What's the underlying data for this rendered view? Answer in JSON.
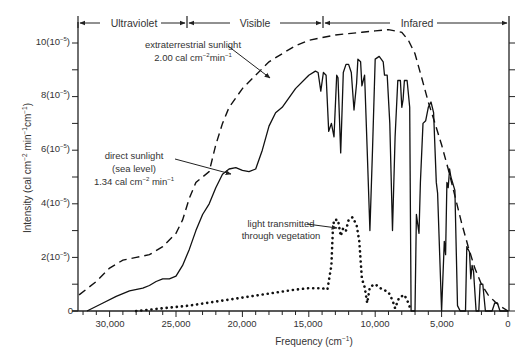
{
  "chart_data": {
    "type": "line",
    "title": "",
    "xlabel": "Frequency (cm⁻¹)",
    "ylabel": "Intensity (cal cm⁻² min⁻¹ cm⁻¹)",
    "xlim": [
      32300,
      0
    ],
    "ylim": [
      0,
      10.6
    ],
    "y_unit_multiplier": "10^-5",
    "x_ticks": [
      {
        "value": 30000,
        "label": "30,000"
      },
      {
        "value": 25000,
        "label": "25,000"
      },
      {
        "value": 20000,
        "label": "20,000"
      },
      {
        "value": 15000,
        "label": "15,000"
      },
      {
        "value": 10000,
        "label": "10,000"
      },
      {
        "value": 5000,
        "label": "5,000"
      },
      {
        "value": 0,
        "label": "0"
      }
    ],
    "y_ticks": [
      {
        "value": 0,
        "label": "0"
      },
      {
        "value": 2,
        "label": "2(10⁻⁵)"
      },
      {
        "value": 4,
        "label": "4(10⁻⁵)"
      },
      {
        "value": 6,
        "label": "6(10⁻⁵)"
      },
      {
        "value": 8,
        "label": "8(10⁻⁵)"
      },
      {
        "value": 10,
        "label": "10(10⁻⁵)"
      }
    ],
    "grid": false,
    "regions": [
      {
        "label": "Ultraviolet",
        "from": 32300,
        "to": 25000
      },
      {
        "label": "Visible",
        "from": 25000,
        "to": 14300
      },
      {
        "label": "Infared",
        "from": 14300,
        "to": 0
      }
    ],
    "series": [
      {
        "name": "extraterrestrial sunlight",
        "annotation": [
          "extraterrestrial sunlight",
          "2.00 cal cm⁻²min⁻¹"
        ],
        "style": "dashed",
        "points": [
          [
            32300,
            0.6
          ],
          [
            31000,
            1.1
          ],
          [
            30000,
            1.6
          ],
          [
            29000,
            1.9
          ],
          [
            28000,
            2.0
          ],
          [
            27000,
            2.1
          ],
          [
            26000,
            2.4
          ],
          [
            25000,
            2.9
          ],
          [
            24500,
            3.4
          ],
          [
            24000,
            4.2
          ],
          [
            23500,
            4.8
          ],
          [
            23000,
            5.0
          ],
          [
            22500,
            5.2
          ],
          [
            22000,
            6.2
          ],
          [
            21500,
            7.0
          ],
          [
            21000,
            7.6
          ],
          [
            20000,
            8.3
          ],
          [
            19000,
            8.8
          ],
          [
            18000,
            9.3
          ],
          [
            17000,
            9.6
          ],
          [
            16000,
            9.9
          ],
          [
            15000,
            10.1
          ],
          [
            14000,
            10.2
          ],
          [
            13000,
            10.3
          ],
          [
            12000,
            10.35
          ],
          [
            11000,
            10.4
          ],
          [
            10000,
            10.45
          ],
          [
            9000,
            10.5
          ],
          [
            8000,
            10.4
          ],
          [
            7500,
            10.1
          ],
          [
            7000,
            9.6
          ],
          [
            6500,
            8.7
          ],
          [
            6000,
            7.8
          ],
          [
            5500,
            7.0
          ],
          [
            5000,
            6.2
          ],
          [
            4500,
            5.3
          ],
          [
            4000,
            4.3
          ],
          [
            3500,
            3.3
          ],
          [
            3000,
            2.4
          ],
          [
            2500,
            1.6
          ],
          [
            2000,
            1.0
          ],
          [
            1500,
            0.6
          ],
          [
            1000,
            0.35
          ],
          [
            500,
            0.15
          ],
          [
            0,
            0.0
          ]
        ]
      },
      {
        "name": "direct sunlight (sea level)",
        "annotation": [
          "direct sunlight",
          "(sea level)",
          "1.34 cal cm⁻² min⁻¹"
        ],
        "style": "solid",
        "points": [
          [
            31700,
            0.0
          ],
          [
            30500,
            0.3
          ],
          [
            29500,
            0.55
          ],
          [
            28500,
            0.75
          ],
          [
            27500,
            0.85
          ],
          [
            27000,
            0.95
          ],
          [
            26500,
            1.1
          ],
          [
            26000,
            1.2
          ],
          [
            25500,
            1.2
          ],
          [
            25000,
            1.3
          ],
          [
            24500,
            1.7
          ],
          [
            24000,
            2.3
          ],
          [
            23500,
            3.0
          ],
          [
            23000,
            3.6
          ],
          [
            22500,
            4.0
          ],
          [
            22000,
            4.6
          ],
          [
            21500,
            5.1
          ],
          [
            21000,
            5.3
          ],
          [
            20500,
            5.35
          ],
          [
            20000,
            5.25
          ],
          [
            19500,
            5.2
          ],
          [
            19000,
            5.3
          ],
          [
            18500,
            6.0
          ],
          [
            18000,
            6.9
          ],
          [
            17500,
            7.4
          ],
          [
            17000,
            7.6
          ],
          [
            16000,
            8.3
          ],
          [
            15000,
            8.8
          ],
          [
            14500,
            8.95
          ],
          [
            14300,
            8.9
          ],
          [
            14100,
            8.2
          ],
          [
            13900,
            8.9
          ],
          [
            13700,
            8.8
          ],
          [
            13500,
            6.7
          ],
          [
            13300,
            7.0
          ],
          [
            13100,
            6.5
          ],
          [
            12900,
            8.8
          ],
          [
            12800,
            8.7
          ],
          [
            12600,
            5.9
          ],
          [
            12400,
            8.9
          ],
          [
            12200,
            9.2
          ],
          [
            12000,
            9.2
          ],
          [
            11800,
            8.9
          ],
          [
            11600,
            7.5
          ],
          [
            11400,
            8.5
          ],
          [
            11300,
            9.4
          ],
          [
            11100,
            9.3
          ],
          [
            11000,
            8.4
          ],
          [
            10800,
            8.8
          ],
          [
            10600,
            6.0
          ],
          [
            10400,
            3.0
          ],
          [
            10200,
            6.0
          ],
          [
            10000,
            9.4
          ],
          [
            9700,
            9.5
          ],
          [
            9400,
            9.3
          ],
          [
            9300,
            8.8
          ],
          [
            9100,
            8.8
          ],
          [
            8900,
            7.0
          ],
          [
            8700,
            3.0
          ],
          [
            8500,
            6.5
          ],
          [
            8300,
            8.6
          ],
          [
            8100,
            8.6
          ],
          [
            8000,
            7.6
          ],
          [
            7900,
            7.9
          ],
          [
            7800,
            8.6
          ],
          [
            7600,
            8.6
          ],
          [
            7400,
            7.6
          ],
          [
            7300,
            0.0
          ],
          [
            7000,
            0.0
          ],
          [
            6900,
            3.6
          ],
          [
            6700,
            2.9
          ],
          [
            6600,
            4.8
          ],
          [
            6400,
            7.0
          ],
          [
            6200,
            7.1
          ],
          [
            6000,
            7.6
          ],
          [
            5800,
            7.8
          ],
          [
            5600,
            7.4
          ],
          [
            5400,
            4.8
          ],
          [
            5300,
            4.4
          ],
          [
            5000,
            0.0
          ],
          [
            4800,
            2.6
          ],
          [
            4700,
            2.1
          ],
          [
            4600,
            4.8
          ],
          [
            4500,
            4.6
          ],
          [
            4400,
            5.3
          ],
          [
            4300,
            5.0
          ],
          [
            4000,
            4.5
          ],
          [
            3800,
            0.2
          ],
          [
            3600,
            0.0
          ],
          [
            3200,
            0.0
          ],
          [
            3100,
            2.4
          ],
          [
            2900,
            2.2
          ],
          [
            2800,
            1.2
          ],
          [
            2700,
            1.7
          ],
          [
            2600,
            1.5
          ],
          [
            2400,
            0.0
          ],
          [
            2200,
            0.0
          ],
          [
            2100,
            1.0
          ],
          [
            1900,
            1.0
          ],
          [
            1700,
            0.0
          ],
          [
            1200,
            0.0
          ],
          [
            1000,
            0.3
          ],
          [
            800,
            0.3
          ],
          [
            600,
            0.0
          ],
          [
            0,
            0.0
          ]
        ]
      },
      {
        "name": "light transmitted through vegetation",
        "annotation": [
          "light transmitted",
          "through vegetation"
        ],
        "style": "dotted",
        "points": [
          [
            28000,
            0.0
          ],
          [
            26000,
            0.1
          ],
          [
            24000,
            0.2
          ],
          [
            22000,
            0.35
          ],
          [
            20000,
            0.5
          ],
          [
            18000,
            0.65
          ],
          [
            16000,
            0.8
          ],
          [
            15000,
            0.85
          ],
          [
            14000,
            0.85
          ],
          [
            13600,
            0.8
          ],
          [
            13300,
            1.7
          ],
          [
            13200,
            2.9
          ],
          [
            13100,
            3.4
          ],
          [
            12800,
            3.4
          ],
          [
            12600,
            2.8
          ],
          [
            12400,
            3.1
          ],
          [
            12200,
            3.0
          ],
          [
            12000,
            3.4
          ],
          [
            11700,
            3.5
          ],
          [
            11400,
            3.2
          ],
          [
            11200,
            2.6
          ],
          [
            11000,
            1.2
          ],
          [
            10800,
            0.9
          ],
          [
            10600,
            0.3
          ],
          [
            10400,
            0.9
          ],
          [
            10000,
            1.0
          ],
          [
            9600,
            0.85
          ],
          [
            9000,
            0.7
          ],
          [
            8700,
            0.4
          ],
          [
            8500,
            0.1
          ],
          [
            8200,
            0.5
          ],
          [
            7800,
            0.6
          ],
          [
            7500,
            0.3
          ],
          [
            7300,
            0.0
          ]
        ]
      }
    ]
  },
  "labels": {
    "y0": "0",
    "y2": "2(10",
    "y4": "4(10",
    "y6": "6(10",
    "y8": "8(10",
    "y10": "10(10",
    "exp": "−5",
    "close": ")",
    "x30": "30,000",
    "x25": "25,000",
    "x20": "20,000",
    "x15": "15,000",
    "x10": "10,000",
    "x5": "5,000",
    "x0": "0",
    "xlabel_main": "Frequency (cm",
    "xlabel_exp": "−1",
    "xlabel_close": ")",
    "ylabel_main": "Intensity (cal cm",
    "ylabel_e1": "−2",
    "ylabel_mid": " min",
    "ylabel_e2": "−1",
    "ylabel_mid2": "cm",
    "ylabel_e3": "−1",
    "ylabel_close": ")",
    "region_uv": "Ultraviolet",
    "region_vis": "Visible",
    "region_ir": "Infared",
    "ann_et_1": "extraterrestrial sunlight",
    "ann_et_2a": "2.00 cal cm",
    "ann_et_2e": "−2",
    "ann_et_2b": "min",
    "ann_et_2e2": "−1",
    "ann_ds_1": "direct sunlight",
    "ann_ds_2": "(sea level)",
    "ann_ds_3a": "1.34 cal cm",
    "ann_ds_3e": "−2",
    "ann_ds_3b": " min",
    "ann_ds_3e2": "−1",
    "ann_veg_1": "light transmitted",
    "ann_veg_2": "through vegetation"
  }
}
